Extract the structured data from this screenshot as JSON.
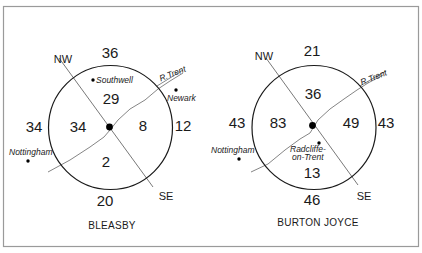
{
  "figure": {
    "frame_color": "#9a9a9a",
    "line_color": "#1a1a1a",
    "panels": [
      {
        "title": "BLEASBY",
        "center_label_color": "#000000",
        "directions": {
          "nw": "NW",
          "se": "SE"
        },
        "river_label": "R.Trent",
        "inner": {
          "north": "29",
          "west": "34",
          "east": "8",
          "south": "2"
        },
        "outer": {
          "north": "36",
          "west": "34",
          "east": "12",
          "south": "20"
        },
        "places": [
          {
            "name": "Southwell"
          },
          {
            "name": "Newark"
          },
          {
            "name": "Nottingham"
          }
        ]
      },
      {
        "title": "BURTON JOYCE",
        "directions": {
          "nw": "NW",
          "se": "SE"
        },
        "river_label": "R.Trent",
        "inner": {
          "north": "36",
          "west": "83",
          "east": "49",
          "south": "13"
        },
        "outer": {
          "north": "21",
          "west": "43",
          "east": "43",
          "south": "46"
        },
        "places": [
          {
            "name": "Nottingham"
          },
          {
            "name_line1": "Radcliffe-",
            "name_line2": "on-Trent"
          }
        ]
      }
    ]
  }
}
